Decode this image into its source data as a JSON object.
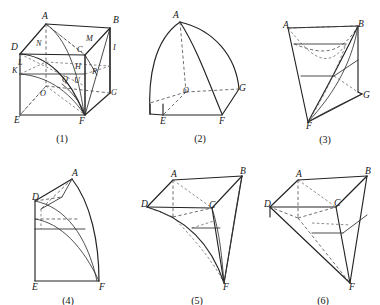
{
  "panel": {
    "title": "Six geometric solid construction figures",
    "background_color": "#ffffff",
    "stroke_color": "#232323",
    "hidden_edge_color": "#4a4a4a",
    "width": 380,
    "height": 305
  },
  "figures": [
    {
      "id": "fig1",
      "caption": "(1)",
      "description": "Cube with inscribed curved surfaces and many construction points",
      "vertex_labels": [
        "A",
        "B",
        "D",
        "C",
        "I",
        "M",
        "N",
        "K",
        "L",
        "O",
        "P",
        "Q",
        "U",
        "H",
        "E",
        "F",
        "G"
      ],
      "labels": [
        {
          "text": "A",
          "x": 42,
          "y": 17
        },
        {
          "text": "B",
          "x": 113,
          "y": 21
        },
        {
          "text": "M",
          "x": 86,
          "y": 39
        },
        {
          "text": "D",
          "x": 11,
          "y": 48
        },
        {
          "text": "N",
          "x": 36,
          "y": 44
        },
        {
          "text": "C",
          "x": 77,
          "y": 50
        },
        {
          "text": "I",
          "x": 113,
          "y": 48
        },
        {
          "text": "L",
          "x": 18,
          "y": 63
        },
        {
          "text": "H",
          "x": 75,
          "y": 67
        },
        {
          "text": "K",
          "x": 12,
          "y": 71
        },
        {
          "text": "P",
          "x": 92,
          "y": 72
        },
        {
          "text": "Q",
          "x": 62,
          "y": 80
        },
        {
          "text": "U",
          "x": 74,
          "y": 81
        },
        {
          "text": "O",
          "x": 40,
          "y": 94
        },
        {
          "text": "G",
          "x": 111,
          "y": 93
        },
        {
          "text": "E",
          "x": 14,
          "y": 121
        },
        {
          "text": "F",
          "x": 79,
          "y": 122
        }
      ],
      "caption_x": 62,
      "caption_y": 140
    },
    {
      "id": "fig2",
      "caption": "(2)",
      "description": "Quarter sphere solid with apex and convex meridian arcs",
      "vertex_labels": [
        "A",
        "O",
        "G",
        "E",
        "F"
      ],
      "labels": [
        {
          "text": "A",
          "x": 173,
          "y": 16
        },
        {
          "text": "O",
          "x": 183,
          "y": 91
        },
        {
          "text": "G",
          "x": 239,
          "y": 89
        },
        {
          "text": "E",
          "x": 160,
          "y": 122
        },
        {
          "text": "F",
          "x": 219,
          "y": 122
        }
      ],
      "caption_x": 200,
      "caption_y": 140
    },
    {
      "id": "fig3",
      "caption": "(3)",
      "description": "Concave funnel solid tapering to a bottom point",
      "vertex_labels": [
        "A",
        "B",
        "G",
        "F"
      ],
      "labels": [
        {
          "text": "A",
          "x": 283,
          "y": 26
        },
        {
          "text": "B",
          "x": 358,
          "y": 25
        },
        {
          "text": "G",
          "x": 363,
          "y": 96
        },
        {
          "text": "F",
          "x": 306,
          "y": 127
        }
      ],
      "caption_x": 325,
      "caption_y": 141
    },
    {
      "id": "fig4",
      "caption": "(4)",
      "description": "Side elevation with apex, convex right arc and rectangular base",
      "vertex_labels": [
        "A",
        "D",
        "E",
        "F"
      ],
      "labels": [
        {
          "text": "A",
          "x": 72,
          "y": 174
        },
        {
          "text": "D",
          "x": 32,
          "y": 198
        },
        {
          "text": "E",
          "x": 32,
          "y": 281
        },
        {
          "text": "F",
          "x": 99,
          "y": 281
        }
      ],
      "caption_x": 68,
      "caption_y": 295
    },
    {
      "id": "fig5",
      "caption": "(5)",
      "description": "Parallelogram top with three concave curved faces meeting at lower point",
      "vertex_labels": [
        "A",
        "B",
        "D",
        "C",
        "F"
      ],
      "labels": [
        {
          "text": "A",
          "x": 171,
          "y": 175
        },
        {
          "text": "B",
          "x": 240,
          "y": 172
        },
        {
          "text": "D",
          "x": 145,
          "y": 205
        },
        {
          "text": "C",
          "x": 209,
          "y": 206
        },
        {
          "text": "F",
          "x": 223,
          "y": 286
        }
      ],
      "caption_x": 197,
      "caption_y": 297
    },
    {
      "id": "fig6",
      "caption": "(6)",
      "description": "Straight edged polyhedron, parallelogram top tapering to lower vertex",
      "vertex_labels": [
        "A",
        "B",
        "D",
        "C",
        "F"
      ],
      "labels": [
        {
          "text": "A",
          "x": 296,
          "y": 175
        },
        {
          "text": "B",
          "x": 365,
          "y": 172
        },
        {
          "text": "D",
          "x": 268,
          "y": 205
        },
        {
          "text": "C",
          "x": 334,
          "y": 204
        },
        {
          "text": "F",
          "x": 348,
          "y": 285
        }
      ],
      "caption_x": 323,
      "caption_y": 297
    }
  ]
}
